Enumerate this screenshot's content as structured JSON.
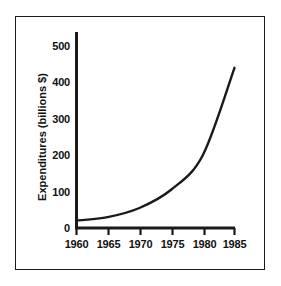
{
  "chart_data": {
    "type": "line",
    "title": "",
    "xlabel": "",
    "ylabel": "Expenditures (billions $)",
    "x": [
      1960,
      1965,
      1970,
      1975,
      1980,
      1985
    ],
    "values": [
      20,
      30,
      55,
      105,
      200,
      440
    ],
    "series": [
      {
        "name": "Expenditures",
        "values": [
          20,
          30,
          55,
          105,
          200,
          440
        ]
      }
    ],
    "xtick_labels": [
      "1960",
      "1965",
      "1970",
      "1975",
      "1980",
      "1985"
    ],
    "ytick_labels": [
      "0",
      "100",
      "200",
      "300",
      "400",
      "500"
    ],
    "xlim": [
      1960,
      1985
    ],
    "ylim": [
      0,
      500
    ],
    "grid": false,
    "legend": false,
    "line_color": "#1a1a1a",
    "background_color": "#ffffff",
    "border_color": "#1a1a1a",
    "annotations": []
  },
  "axes": {
    "y_title": "Expenditures (billions $)",
    "y_ticks": [
      {
        "label": "500",
        "value": 500
      },
      {
        "label": "400",
        "value": 400
      },
      {
        "label": "300",
        "value": 300
      },
      {
        "label": "200",
        "value": 200
      },
      {
        "label": "100",
        "value": 100
      },
      {
        "label": "0",
        "value": 0
      }
    ],
    "x_ticks": [
      {
        "label": "1960",
        "value": 1960
      },
      {
        "label": "1965",
        "value": 1965
      },
      {
        "label": "1970",
        "value": 1970
      },
      {
        "label": "1975",
        "value": 1975
      },
      {
        "label": "1980",
        "value": 1980
      },
      {
        "label": "1985",
        "value": 1985
      }
    ]
  }
}
